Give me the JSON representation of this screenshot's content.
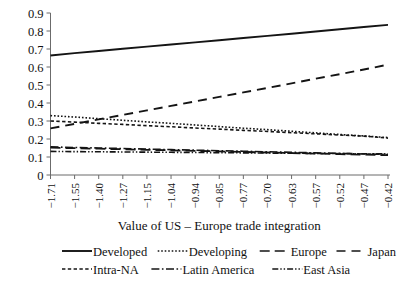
{
  "chart_data": {
    "type": "line",
    "title": "",
    "xlabel": "Value of US – Europe trade integration",
    "ylabel": "",
    "ylim": [
      0,
      0.9
    ],
    "grid": false,
    "legend_position": "bottom",
    "x_tick_labels": [
      "−1.71",
      "−1.55",
      "−1.40",
      "−1.27",
      "−1.15",
      "−1.04",
      "−0.94",
      "−0.85",
      "−0.77",
      "−0.70",
      "−0.63",
      "−0.57",
      "−0.52",
      "−0.47",
      "−0.42"
    ],
    "y_tick_labels": [
      "0",
      "0.1",
      "0.2",
      "0.3",
      "0.4",
      "0.5",
      "0.6",
      "0.7",
      "0.8",
      "0.9"
    ],
    "y_tick_values": [
      0,
      0.1,
      0.2,
      0.3,
      0.4,
      0.5,
      0.6,
      0.7,
      0.8,
      0.9
    ],
    "categories": [
      "−1.71",
      "−1.55",
      "−1.40",
      "−1.27",
      "−1.15",
      "−1.04",
      "−0.94",
      "−0.85",
      "−0.77",
      "−0.70",
      "−0.63",
      "−0.57",
      "−0.52",
      "−0.47",
      "−0.42"
    ],
    "series": [
      {
        "name": "Developed",
        "style": "solid",
        "dash": "none",
        "width": 1.9,
        "color": "#141414",
        "values": [
          0.664,
          0.677,
          0.689,
          0.701,
          0.713,
          0.725,
          0.737,
          0.749,
          0.761,
          0.773,
          0.785,
          0.797,
          0.81,
          0.822,
          0.834
        ]
      },
      {
        "name": "Developing",
        "style": "dotted",
        "dash": "1.6,1.9",
        "width": 1.6,
        "color": "#141414",
        "values": [
          0.33,
          0.322,
          0.313,
          0.304,
          0.295,
          0.287,
          0.278,
          0.269,
          0.26,
          0.252,
          0.243,
          0.234,
          0.225,
          0.217,
          0.208
        ]
      },
      {
        "name": "Europe",
        "style": "long-dash",
        "dash": "10,5",
        "width": 1.8,
        "color": "#141414",
        "values": [
          0.152,
          0.149,
          0.146,
          0.143,
          0.14,
          0.137,
          0.134,
          0.131,
          0.128,
          0.125,
          0.122,
          0.119,
          0.116,
          0.113,
          0.11
        ]
      },
      {
        "name": "Japan",
        "style": "dashed",
        "dash": "9,6",
        "width": 1.9,
        "color": "#141414",
        "values": [
          0.259,
          0.284,
          0.309,
          0.334,
          0.359,
          0.384,
          0.409,
          0.434,
          0.459,
          0.484,
          0.509,
          0.535,
          0.56,
          0.586,
          0.613
        ]
      },
      {
        "name": "Intra-NA",
        "style": "short-dash",
        "dash": "3.4,2.4",
        "width": 1.6,
        "color": "#141414",
        "values": [
          0.3,
          0.294,
          0.287,
          0.281,
          0.274,
          0.268,
          0.261,
          0.255,
          0.248,
          0.242,
          0.235,
          0.229,
          0.222,
          0.216,
          0.205
        ]
      },
      {
        "name": "Latin America",
        "style": "dash-dot",
        "dash": "8,2.5,1.6,2.5",
        "width": 1.6,
        "color": "#141414",
        "values": [
          0.156,
          0.153,
          0.15,
          0.147,
          0.144,
          0.141,
          0.138,
          0.135,
          0.132,
          0.129,
          0.126,
          0.123,
          0.12,
          0.117,
          0.114
        ]
      },
      {
        "name": "East Asia",
        "style": "dash-dot-dot",
        "dash": "6,2,1.4,2,1.4,2",
        "width": 1.6,
        "color": "#141414",
        "values": [
          0.131,
          0.13,
          0.129,
          0.128,
          0.127,
          0.126,
          0.125,
          0.124,
          0.123,
          0.122,
          0.121,
          0.12,
          0.119,
          0.118,
          0.117
        ]
      }
    ]
  },
  "legend": {
    "row1": [
      {
        "label": "Developed",
        "dash": "none"
      },
      {
        "label": "Developing",
        "dash": "1.6,1.9"
      },
      {
        "label": "Europe",
        "dash": "10,5"
      },
      {
        "label": "Japan",
        "dash": "9,6"
      }
    ],
    "row2": [
      {
        "label": "Intra-NA",
        "dash": "3.4,2.4"
      },
      {
        "label": "Latin America",
        "dash": "8,2.5,1.6,2.5"
      },
      {
        "label": "East Asia",
        "dash": "6,2,1.4,2,1.4,2"
      }
    ]
  },
  "colors": {
    "line": "#141414",
    "axis": "#6b6b6b",
    "background": "#ffffff",
    "text": "#111111"
  }
}
